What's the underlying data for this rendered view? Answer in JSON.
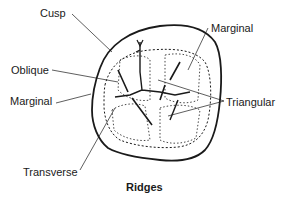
{
  "figure": {
    "caption": "Ridges",
    "labels": {
      "cusp": "Cusp",
      "marginal_top": "Marginal",
      "oblique": "Oblique",
      "marginal_left": "Marginal",
      "triangular": "Triangular",
      "transverse": "Transverse"
    },
    "colors": {
      "ink": "#1a1a1a",
      "background": "#ffffff"
    }
  }
}
